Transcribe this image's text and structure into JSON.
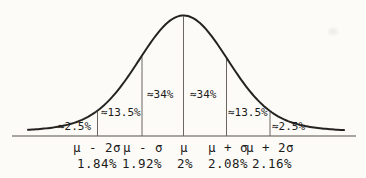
{
  "figure": {
    "colors": {
      "background": "#fcfbf8",
      "ink": "#242320",
      "axis_gray": "#8b8880",
      "divider_gray": "#6a6761"
    }
  },
  "chart_data": {
    "type": "area",
    "distribution": "normal",
    "grid": false,
    "legend": "none",
    "area_labels": [
      "≈2.5%",
      "≈13.5%",
      "≈34%",
      "≈34%",
      "≈13.5%",
      "≈2.5%"
    ],
    "area_values_percent": [
      2.5,
      13.5,
      34,
      34,
      13.5,
      2.5
    ],
    "x_tick_symbols": [
      "μ - 2σ",
      "μ - σ",
      "μ",
      "μ + σ",
      "μ + 2σ"
    ],
    "x_tick_values": [
      "1.84%",
      "1.92%",
      "2%",
      "2.08%",
      "2.16%"
    ],
    "x_tick_values_numeric": [
      1.84,
      1.92,
      2,
      2.08,
      2.16
    ],
    "mean_percent": 2,
    "sigma_percent": 0.08,
    "x_sigma_range": [
      -2,
      2
    ]
  }
}
